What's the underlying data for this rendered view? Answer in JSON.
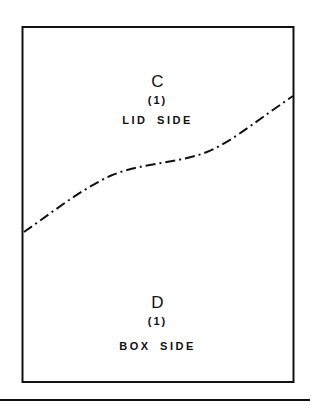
{
  "figure": {
    "type": "patent-diagram",
    "upper_region": {
      "letter": "C",
      "number": "(1)",
      "label": "LID SIDE"
    },
    "lower_region": {
      "letter": "D",
      "number": "(1)",
      "label": "BOX SIDE"
    },
    "divider_line": {
      "style": "dash-dot",
      "description": "curved separation line between lid side and box side"
    },
    "colors": {
      "ink": "#111111",
      "background": "#ffffff"
    }
  }
}
